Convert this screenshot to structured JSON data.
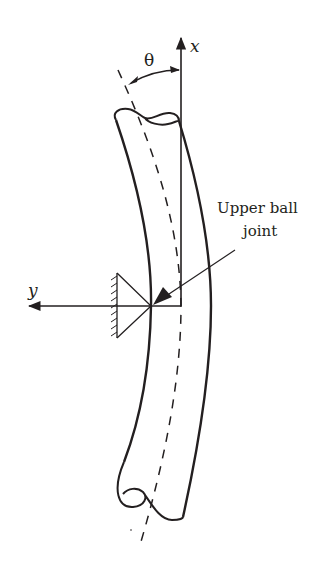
{
  "diagram": {
    "labels": {
      "x_axis": "x",
      "y_axis": "y",
      "angle": "θ",
      "joint_line1": "Upper ball",
      "joint_line2": "joint"
    },
    "colors": {
      "stroke": "#231f20",
      "background": "#ffffff"
    },
    "elements": [
      {
        "name": "x-axis",
        "type": "arrow",
        "direction": "up"
      },
      {
        "name": "y-axis",
        "type": "arrow",
        "direction": "left"
      },
      {
        "name": "shaft",
        "type": "curved-cylinder",
        "broken_ends": true
      },
      {
        "name": "shaft-centerline",
        "type": "dashed-line"
      },
      {
        "name": "angle-theta",
        "type": "arc-arrow"
      },
      {
        "name": "pin-support",
        "type": "triangle-with-hatching"
      },
      {
        "name": "joint-leader",
        "type": "arrow"
      }
    ]
  }
}
